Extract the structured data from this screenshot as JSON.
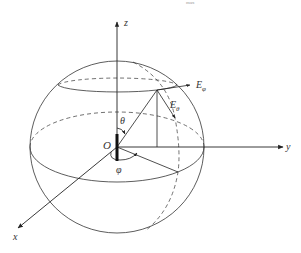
{
  "diagram": {
    "type": "spherical-coordinate-system",
    "cropped_top_text": "max",
    "labels": {
      "z": "z",
      "y": "y",
      "x": "x",
      "origin": "O",
      "theta": "θ",
      "phi": "φ",
      "e_phi_main": "E",
      "e_phi_sub": "φ",
      "e_theta_main": "E",
      "e_theta_sub": "θ"
    },
    "colors": {
      "line": "#222222",
      "text": "#333333",
      "background": "#ffffff"
    }
  }
}
